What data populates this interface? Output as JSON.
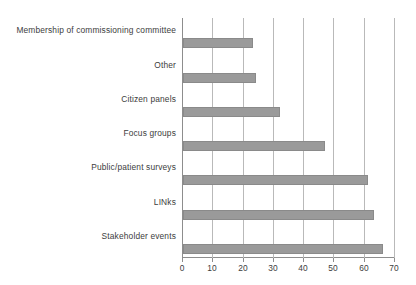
{
  "chart_data": {
    "type": "bar",
    "orientation": "horizontal",
    "title": "",
    "subtitle": "",
    "xlabel": "",
    "ylabel": "",
    "categories": [
      "Membership of commissioning committee",
      "Other",
      "Citizen panels",
      "Focus groups",
      "Public/patient surveys",
      "LINks",
      "Stakeholder events"
    ],
    "values": [
      23,
      24,
      32,
      47,
      61,
      63,
      66
    ],
    "xticks": [
      0,
      10,
      20,
      30,
      40,
      50,
      60,
      70
    ],
    "xlim": [
      0,
      70
    ],
    "grid": "vertical",
    "legend": "none",
    "series": [
      {
        "name": "",
        "values": [
          23,
          24,
          32,
          47,
          61,
          63,
          66
        ]
      }
    ]
  },
  "style": {
    "bar_color": "#9a9a9a",
    "bar_border_color": "#8a8a8a",
    "gridline_color": "#b9b9b9",
    "axis_color": "#8d8d8d",
    "text_color": "#3d3d3d",
    "background": "#ffffff"
  }
}
